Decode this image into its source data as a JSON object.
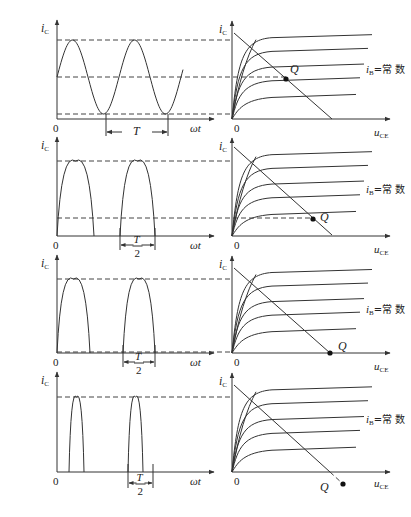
{
  "figure": {
    "width": 411,
    "height": 517,
    "colors": {
      "line": "#333333",
      "dash": "#444444",
      "text": "#222222",
      "point": "#111111"
    },
    "labels": {
      "ic": "i",
      "ic_sub": "C",
      "uce": "u",
      "uce_sub": "CE",
      "wt": "ωt",
      "zero": "0",
      "ib": "i",
      "ib_sub": "B",
      "ib_eq": "=常 数",
      "q": "Q",
      "T": "T",
      "two": "2"
    },
    "panels": [
      {
        "id": "a",
        "label": "（a）",
        "waveform": "full sine (class A)",
        "period_label": "T",
        "period_is_half": false,
        "has_ib_label": true,
        "q_position": "middle of load line"
      },
      {
        "id": "b",
        "label": "（b）",
        "waveform": "pulses wider than half period (class AB)",
        "period_label": "T/2",
        "period_is_half": true,
        "has_ib_label": true,
        "q_position": "near low end of load line"
      },
      {
        "id": "c",
        "label": "（c）",
        "waveform": "half-wave pulses (class B)",
        "period_label": "T/2",
        "period_is_half": true,
        "has_ib_label": true,
        "q_position": "on u_CE axis (cutoff)"
      },
      {
        "id": "d",
        "label": "（d）",
        "waveform": "narrow pulses (class C)",
        "period_label": "T/2",
        "period_is_half": true,
        "has_ib_label": true,
        "q_position": "beyond cutoff, below u_CE axis"
      }
    ]
  }
}
